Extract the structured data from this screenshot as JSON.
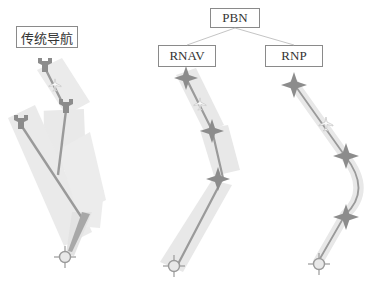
{
  "labels": {
    "traditional": "传统导航",
    "pbn": "PBN",
    "rnav": "RNAV",
    "rnp": "RNP"
  },
  "colors": {
    "corridor": "#e6e6e6",
    "track": "#9a9a9a",
    "waypoint": "#8c8c8c",
    "box_border": "#8a8a8a",
    "text": "#333333"
  },
  "diagrams": [
    {
      "name": "traditional-navigation",
      "waypoint_symbol": "VOR/NDB station",
      "legs": 3
    },
    {
      "name": "rnav",
      "waypoint_symbol": "four-point star",
      "legs": 3
    },
    {
      "name": "rnp",
      "waypoint_symbol": "four-point star",
      "legs": 3,
      "curved_turn": true
    }
  ]
}
